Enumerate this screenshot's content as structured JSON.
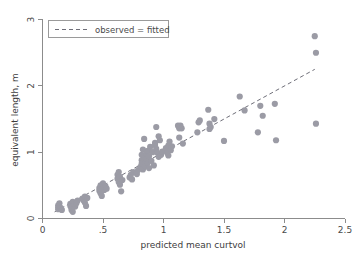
{
  "chart_data": {
    "type": "scatter",
    "title": "",
    "xlabel": "predicted mean curtvol",
    "ylabel": "equivalent length, m",
    "xlim": [
      0,
      2.5
    ],
    "ylim": [
      0,
      3
    ],
    "xticks": [
      0,
      0.5,
      1,
      1.5,
      2,
      2.5
    ],
    "xticklabels": [
      "0",
      ".5",
      "1",
      "1.5",
      "2",
      "2.5"
    ],
    "yticks": [
      0,
      1,
      2,
      3
    ],
    "yticklabels": [
      "0",
      "1",
      "2",
      "3"
    ],
    "grid": false,
    "legend_position": "top-left",
    "legend": [
      {
        "label": "observed = fitted",
        "style": "dashed-line",
        "color": "#6e6e78"
      }
    ],
    "reference_line": {
      "label": "observed = fitted",
      "slope": 1,
      "intercept": 0,
      "x_start": 0.1,
      "x_end": 2.25,
      "y_start": 0.1,
      "y_end": 2.25,
      "style": "dashed"
    },
    "marker": {
      "shape": "circle",
      "color": "#9b9ba5",
      "size_px": 3.1
    },
    "series": [
      {
        "name": "observations",
        "points": [
          [
            0.13,
            0.2
          ],
          [
            0.13,
            0.17
          ],
          [
            0.13,
            0.14
          ],
          [
            0.14,
            0.23
          ],
          [
            0.15,
            0.16
          ],
          [
            0.16,
            0.13
          ],
          [
            0.23,
            0.22
          ],
          [
            0.23,
            0.19
          ],
          [
            0.24,
            0.16
          ],
          [
            0.24,
            0.13
          ],
          [
            0.25,
            0.25
          ],
          [
            0.25,
            0.1
          ],
          [
            0.26,
            0.21
          ],
          [
            0.27,
            0.18
          ],
          [
            0.28,
            0.23
          ],
          [
            0.29,
            0.27
          ],
          [
            0.33,
            0.3
          ],
          [
            0.34,
            0.27
          ],
          [
            0.35,
            0.33
          ],
          [
            0.35,
            0.24
          ],
          [
            0.36,
            0.19
          ],
          [
            0.37,
            0.31
          ],
          [
            0.47,
            0.46
          ],
          [
            0.47,
            0.42
          ],
          [
            0.48,
            0.5
          ],
          [
            0.48,
            0.38
          ],
          [
            0.49,
            0.34
          ],
          [
            0.5,
            0.53
          ],
          [
            0.5,
            0.47
          ],
          [
            0.51,
            0.43
          ],
          [
            0.52,
            0.49
          ],
          [
            0.53,
            0.45
          ],
          [
            0.62,
            0.66
          ],
          [
            0.62,
            0.6
          ],
          [
            0.63,
            0.7
          ],
          [
            0.63,
            0.55
          ],
          [
            0.64,
            0.51
          ],
          [
            0.64,
            0.63
          ],
          [
            0.65,
            0.41
          ],
          [
            0.66,
            0.58
          ],
          [
            0.72,
            0.62
          ],
          [
            0.73,
            0.66
          ],
          [
            0.74,
            0.59
          ],
          [
            0.75,
            0.7
          ],
          [
            0.78,
            0.67
          ],
          [
            0.79,
            0.73
          ],
          [
            0.81,
            0.78
          ],
          [
            0.82,
            0.96
          ],
          [
            0.82,
            0.88
          ],
          [
            0.82,
            0.83
          ],
          [
            0.83,
            1.04
          ],
          [
            0.83,
            0.74
          ],
          [
            0.84,
            1.2
          ],
          [
            0.84,
            0.92
          ],
          [
            0.85,
            0.86
          ],
          [
            0.85,
            0.79
          ],
          [
            0.86,
            0.98
          ],
          [
            0.86,
            0.9
          ],
          [
            0.87,
            1.02
          ],
          [
            0.87,
            0.84
          ],
          [
            0.88,
            0.94
          ],
          [
            0.88,
            0.76
          ],
          [
            0.89,
            1.08
          ],
          [
            0.9,
            0.87
          ],
          [
            0.91,
            1.0
          ],
          [
            0.92,
            0.8
          ],
          [
            0.93,
            1.14
          ],
          [
            0.93,
            1.11
          ],
          [
            0.94,
            1.38
          ],
          [
            0.94,
            1.05
          ],
          [
            0.95,
            0.99
          ],
          [
            0.96,
            1.24
          ],
          [
            0.96,
            0.93
          ],
          [
            0.97,
            1.18
          ],
          [
            0.98,
            0.96
          ],
          [
            0.99,
            1.01
          ],
          [
            1.02,
            1.06
          ],
          [
            1.03,
            0.99
          ],
          [
            1.04,
            1.1
          ],
          [
            1.04,
            0.95
          ],
          [
            1.05,
            1.16
          ],
          [
            1.06,
            1.03
          ],
          [
            1.07,
            1.09
          ],
          [
            1.12,
            1.4
          ],
          [
            1.13,
            1.36
          ],
          [
            1.13,
            1.22
          ],
          [
            1.14,
            1.4
          ],
          [
            1.15,
            1.36
          ],
          [
            1.16,
            1.13
          ],
          [
            1.28,
            1.3
          ],
          [
            1.29,
            1.45
          ],
          [
            1.3,
            1.48
          ],
          [
            1.37,
            1.64
          ],
          [
            1.38,
            1.43
          ],
          [
            1.38,
            1.35
          ],
          [
            1.39,
            1.38
          ],
          [
            1.42,
            1.5
          ],
          [
            1.5,
            1.17
          ],
          [
            1.63,
            1.84
          ],
          [
            1.67,
            1.63
          ],
          [
            1.78,
            1.3
          ],
          [
            1.8,
            1.7
          ],
          [
            1.82,
            1.55
          ],
          [
            1.92,
            1.73
          ],
          [
            1.93,
            1.18
          ],
          [
            2.25,
            2.75
          ],
          [
            2.26,
            2.5
          ],
          [
            2.26,
            1.43
          ]
        ]
      }
    ]
  }
}
